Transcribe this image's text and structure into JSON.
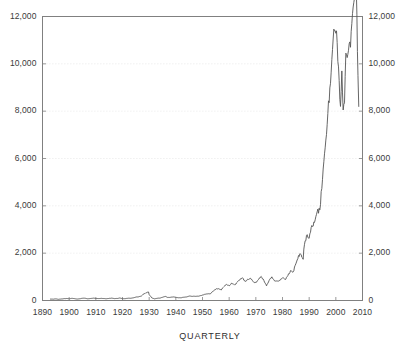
{
  "chart_data": {
    "type": "line",
    "title": "",
    "subtitle": "",
    "xlabel": "QUARTERLY",
    "ylabel": "",
    "xlim": [
      1890,
      2010
    ],
    "ylim": [
      0,
      12000
    ],
    "grid": true,
    "grid_axis": "y",
    "legend": "none",
    "dual_y_axis": true,
    "series_name": "index-level",
    "line_color": "#555555",
    "background_color": "#ffffff",
    "axis_color": "#808080",
    "grid_color": "#dcdcdc",
    "y_ticks_left": [
      "0",
      "2,000",
      "4,000",
      "6,000",
      "8,000",
      "10,000",
      "12,000"
    ],
    "y_ticks_right": [
      "0",
      "2,000",
      "4,000",
      "6,000",
      "8,000",
      "10,000",
      "12,000"
    ],
    "y_tick_values": [
      0,
      2000,
      4000,
      6000,
      8000,
      10000,
      12000
    ],
    "x_ticks": [
      "1890",
      "1900",
      "1910",
      "1920",
      "1930",
      "1940",
      "1950",
      "1960",
      "1970",
      "1980",
      "1990",
      "2000",
      "2010"
    ],
    "x_tick_values": [
      1890,
      1900,
      1910,
      1920,
      1930,
      1940,
      1950,
      1960,
      1970,
      1980,
      1990,
      2000,
      2010
    ],
    "x": [
      1893.0,
      1894.0,
      1895.0,
      1896.0,
      1897.0,
      1898.0,
      1899.0,
      1900.0,
      1901.0,
      1902.0,
      1903.0,
      1904.0,
      1905.0,
      1906.0,
      1907.0,
      1908.0,
      1909.0,
      1910.0,
      1911.0,
      1912.0,
      1913.0,
      1914.0,
      1915.0,
      1916.0,
      1917.0,
      1918.0,
      1919.0,
      1920.0,
      1921.0,
      1922.0,
      1923.0,
      1924.0,
      1925.0,
      1926.0,
      1927.0,
      1928.0,
      1929.0,
      1929.75,
      1930.0,
      1931.0,
      1932.0,
      1933.0,
      1934.0,
      1935.0,
      1936.0,
      1937.0,
      1938.0,
      1939.0,
      1940.0,
      1941.0,
      1942.0,
      1943.0,
      1944.0,
      1945.0,
      1946.0,
      1947.0,
      1948.0,
      1949.0,
      1950.0,
      1951.0,
      1952.0,
      1953.0,
      1954.0,
      1955.0,
      1956.0,
      1957.0,
      1958.0,
      1959.0,
      1960.0,
      1961.0,
      1962.0,
      1963.0,
      1964.0,
      1965.0,
      1966.0,
      1967.0,
      1968.0,
      1969.0,
      1970.0,
      1971.0,
      1972.0,
      1973.0,
      1974.0,
      1975.0,
      1976.0,
      1977.0,
      1978.0,
      1979.0,
      1980.0,
      1981.0,
      1982.0,
      1983.0,
      1984.0,
      1985.0,
      1986.0,
      1987.0,
      1987.75,
      1988.0,
      1989.0,
      1990.0,
      1991.0,
      1992.0,
      1993.0,
      1994.0,
      1995.0,
      1996.0,
      1997.0,
      1998.0,
      1999.0,
      1999.75,
      2000.5,
      2001.0,
      2001.75,
      2002.25,
      2002.75,
      2003.25,
      2003.75,
      2004.5,
      2005.5,
      2006.5,
      2007.5,
      2007.9,
      2008.3,
      2008.6
    ],
    "y": [
      60,
      55,
      70,
      50,
      65,
      75,
      85,
      70,
      90,
      80,
      60,
      75,
      95,
      95,
      70,
      85,
      100,
      85,
      82,
      90,
      82,
      75,
      90,
      100,
      80,
      85,
      105,
      75,
      80,
      95,
      95,
      110,
      145,
      155,
      180,
      280,
      330,
      360,
      250,
      110,
      70,
      95,
      100,
      135,
      175,
      125,
      135,
      150,
      135,
      115,
      115,
      140,
      150,
      190,
      175,
      180,
      180,
      195,
      230,
      265,
      280,
      285,
      400,
      485,
      500,
      440,
      580,
      680,
      620,
      730,
      650,
      770,
      870,
      960,
      800,
      900,
      940,
      800,
      750,
      890,
      1020,
      850,
      620,
      850,
      1000,
      830,
      810,
      840,
      960,
      880,
      1050,
      1260,
      1210,
      1550,
      1900,
      1940,
      1740,
      2170,
      2750,
      2630,
      3170,
      3300,
      3750,
      3830,
      5120,
      6450,
      7900,
      9180,
      11050,
      11400,
      10900,
      9870,
      8200,
      9700,
      8050,
      8350,
      10450,
      10400,
      10700,
      12400,
      13300,
      12100,
      9500,
      8200
    ]
  }
}
